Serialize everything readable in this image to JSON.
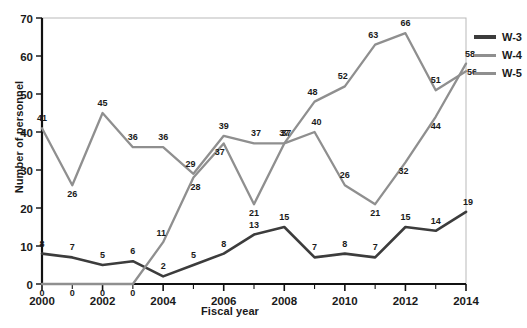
{
  "chart_data": {
    "type": "line",
    "title": "",
    "xlabel": "Fiscal year",
    "ylabel": "Number of personnel",
    "x": [
      2000,
      2001,
      2002,
      2003,
      2004,
      2005,
      2006,
      2007,
      2008,
      2009,
      2010,
      2011,
      2012,
      2013,
      2014
    ],
    "xlim": [
      2000,
      2014
    ],
    "ylim": [
      0,
      70
    ],
    "yticks": [
      0,
      10,
      20,
      30,
      40,
      50,
      60,
      70
    ],
    "xticks_major": [
      2000,
      2002,
      2004,
      2006,
      2008,
      2010,
      2012,
      2014
    ],
    "xticks_minor": [
      2001,
      2003,
      2005,
      2007,
      2009,
      2011,
      2013
    ],
    "grid": false,
    "legend_position": "right",
    "data_labels": true,
    "series": [
      {
        "name": "W-3",
        "color": "#3c3c3c",
        "values": [
          8,
          7,
          5,
          6,
          2,
          5,
          8,
          13,
          15,
          7,
          8,
          7,
          15,
          14,
          19
        ]
      },
      {
        "name": "W-4",
        "color": "#8f8f8f",
        "values": [
          41,
          26,
          45,
          36,
          36,
          29,
          39,
          37,
          37,
          48,
          52,
          63,
          66,
          51,
          56
        ]
      },
      {
        "name": "W-5",
        "color": "#8f8f8f",
        "values": [
          0,
          0,
          0,
          0,
          11,
          28,
          37,
          21,
          37,
          40,
          26,
          21,
          32,
          44,
          58
        ]
      }
    ]
  },
  "legend": {
    "items": [
      {
        "label": "W-3",
        "color": "#3c3c3c"
      },
      {
        "label": "W-4",
        "color": "#8f8f8f"
      },
      {
        "label": "W-5",
        "color": "#8f8f8f"
      }
    ]
  },
  "axes": {
    "x_title": "Fiscal year",
    "y_title": "Number of personnel"
  }
}
